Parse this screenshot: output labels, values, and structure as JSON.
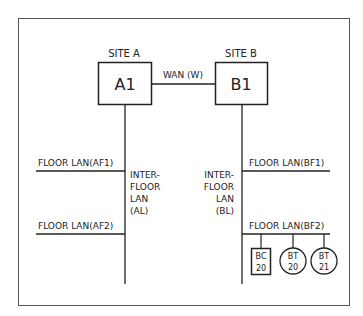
{
  "sites": [
    {
      "label": "SITE A",
      "node": "A1"
    },
    {
      "label": "SITE B",
      "node": "B1"
    }
  ],
  "wan": {
    "label": "WAN (W)"
  },
  "inter_floor": {
    "a": [
      "INTER-",
      "FLOOR",
      "LAN",
      "(AL)"
    ],
    "b": [
      "INTER-",
      "FLOOR",
      "LAN",
      "(BL)"
    ]
  },
  "floor_lans": {
    "af1": "FLOOR LAN(AF1)",
    "af2": "FLOOR LAN(AF2)",
    "bf1": "FLOOR LAN(BF1)",
    "bf2": "FLOOR LAN(BF2)"
  },
  "devices": [
    {
      "shape": "square",
      "line1": "BC",
      "line2": "20"
    },
    {
      "shape": "circle",
      "line1": "BT",
      "line2": "20"
    },
    {
      "shape": "circle",
      "line1": "BT",
      "line2": "21"
    }
  ]
}
